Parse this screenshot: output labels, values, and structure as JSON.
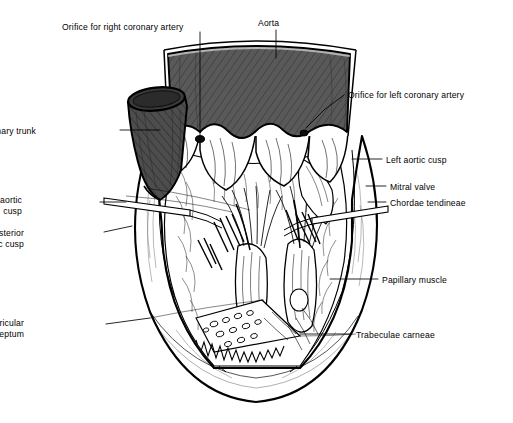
{
  "figure": {
    "background_color": "#ffffff",
    "ink_color": "#000000",
    "vessel_fill": "#5a5a5a",
    "vessel_fill_dark": "#4a4a4a",
    "tissue_fill": "#ffffff",
    "leader_color": "#000000"
  },
  "labels": [
    {
      "id": "orifice-right-coronary-artery",
      "text": "Orifice for right coronary artery",
      "align": "left",
      "x": 62,
      "y": 22
    },
    {
      "id": "aorta",
      "text": "Aorta",
      "align": "left",
      "x": 258,
      "y": 18
    },
    {
      "id": "orifice-left-coronary-artery",
      "text": "Orifice for left coronary artery",
      "align": "left",
      "x": 348,
      "y": 90
    },
    {
      "id": "pulmonary-trunk",
      "text": "Pulmonary trunk",
      "align": "right",
      "x": 36,
      "y": 126
    },
    {
      "id": "left-aortic-cusp",
      "text": "Left aortic cusp",
      "align": "left",
      "x": 386,
      "y": 155
    },
    {
      "id": "mitral-valve",
      "text": "Mitral valve",
      "align": "left",
      "x": 390,
      "y": 182
    },
    {
      "id": "chordae-tendineae",
      "text": "Chordae tendineae",
      "align": "left",
      "x": 390,
      "y": 198
    },
    {
      "id": "right-aortic-cusp",
      "text": "Right aortic\ncusp",
      "align": "right",
      "x": 22,
      "y": 195
    },
    {
      "id": "posterior-aortic-cusp",
      "text": "Posterior\naortic cusp",
      "align": "right",
      "x": 24,
      "y": 228
    },
    {
      "id": "papillary-muscle",
      "text": "Papillary muscle",
      "align": "left",
      "x": 382,
      "y": 275
    },
    {
      "id": "interventricular-septum",
      "text": "Interventricular\nseptum",
      "align": "right",
      "x": 24,
      "y": 318
    },
    {
      "id": "trabeculae-carneae",
      "text": "Trabeculae carneae",
      "align": "left",
      "x": 356,
      "y": 330
    }
  ],
  "leaders": [
    {
      "id": "leader-orifice-right-coronary-artery",
      "points": "200,32 200,139"
    },
    {
      "id": "leader-aorta",
      "points": "276,30 276,58"
    },
    {
      "id": "leader-orifice-left-coronary-artery",
      "points": "344,95 324,110 306,128"
    },
    {
      "id": "leader-pulmonary-trunk",
      "points": "120,130 160,130"
    },
    {
      "id": "leader-left-aortic-cusp",
      "points": "382,159 352,159"
    },
    {
      "id": "leader-mitral-valve",
      "points": "386,186 366,186"
    },
    {
      "id": "leader-chordae-tendineae",
      "points": "386,202 368,202"
    },
    {
      "id": "leader-right-aortic-cusp",
      "points": "100,202 126,202"
    },
    {
      "id": "leader-posterior-aortic-cusp",
      "points": "104,232 132,226"
    },
    {
      "id": "leader-papillary-muscle",
      "points": "378,279 330,279"
    },
    {
      "id": "leader-interventricular-septum",
      "points": "106,324 150,318"
    },
    {
      "id": "leader-trabeculae-carneae",
      "points": "352,334 300,334"
    }
  ],
  "structures": [
    {
      "id": "aorta-body",
      "name": "aorta"
    },
    {
      "id": "pulmonary-trunk-body",
      "name": "pulmonary-trunk"
    },
    {
      "id": "aortic-cusps",
      "name": "aortic-valve-cusps",
      "count": 3
    },
    {
      "id": "ventricle-wall",
      "name": "myocardial-wall"
    },
    {
      "id": "ventricle-cavity",
      "name": "left-ventricular-cavity"
    },
    {
      "id": "papillary-muscles",
      "name": "papillary-muscles"
    },
    {
      "id": "chordae",
      "name": "chordae-tendineae"
    },
    {
      "id": "trabeculae",
      "name": "trabeculae-carneae"
    },
    {
      "id": "probe-left",
      "name": "dissection-probe-left"
    },
    {
      "id": "probe-right",
      "name": "dissection-probe-right"
    },
    {
      "id": "orifice-marker-right",
      "name": "right-coronary-orifice-marker"
    },
    {
      "id": "orifice-marker-left",
      "name": "left-coronary-orifice-marker"
    }
  ]
}
